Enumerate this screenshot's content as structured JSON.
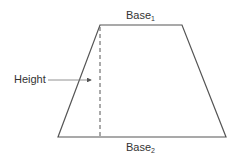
{
  "diagram": {
    "shape": "trapezoid",
    "labels": {
      "base1": {
        "text": "Base",
        "subscript": "1"
      },
      "base2": {
        "text": "Base",
        "subscript": "2"
      },
      "height": "Height"
    },
    "colors": {
      "stroke": "#555555",
      "text": "#333333",
      "background": "#ffffff"
    }
  }
}
